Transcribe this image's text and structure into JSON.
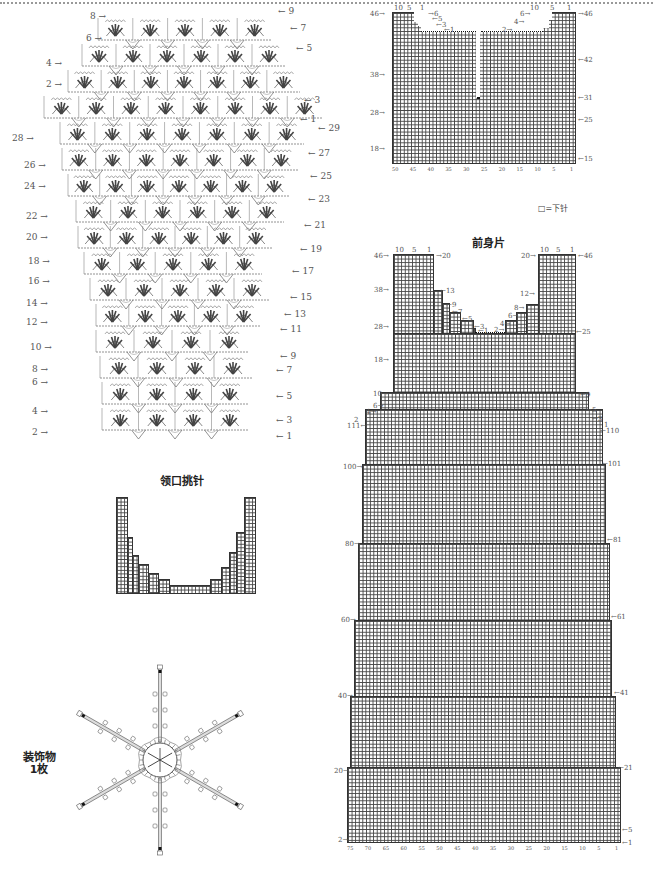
{
  "page": {
    "border": "dotted-top-rule"
  },
  "crochet_chart": {
    "description": "Crochet fan stitch chart",
    "left_row_labels": [
      "8",
      "6",
      "4",
      "2",
      "28",
      "26",
      "24",
      "22",
      "20",
      "18",
      "16",
      "14",
      "12",
      "10",
      "8",
      "6",
      "4",
      "2"
    ],
    "right_row_labels": [
      "9",
      "7",
      "5",
      "3",
      "1",
      "29",
      "27",
      "25",
      "23",
      "21",
      "19",
      "17",
      "15",
      "13",
      "11",
      "9",
      "7",
      "5",
      "3",
      "1"
    ]
  },
  "back_neck": {
    "title": "后领",
    "top_left_ticks": [
      "10",
      "5",
      "1"
    ],
    "top_right_ticks": [
      "10",
      "5",
      "1"
    ],
    "left_row_labels": [
      "46",
      "38",
      "28",
      "18"
    ],
    "right_row_labels": [
      "46",
      "42",
      "31",
      "25",
      "15"
    ],
    "neck_left_labels": [
      "6",
      "5",
      "3",
      "1"
    ],
    "neck_right_labels": [
      "6",
      "4",
      "2"
    ],
    "bottom_ticks": [
      "50",
      "45",
      "40",
      "35",
      "30",
      "25",
      "20",
      "15",
      "10",
      "5",
      "1"
    ]
  },
  "legend": {
    "symbol": "□",
    "text": "=下针"
  },
  "front_body": {
    "title": "前身片",
    "top_left_ticks": [
      "10",
      "5",
      "1"
    ],
    "top_right_ticks": [
      "10",
      "5",
      "1"
    ],
    "left_row_labels": [
      "46",
      "38",
      "28",
      "18",
      "10",
      "6",
      "4",
      "2",
      "111",
      "100",
      "80",
      "60",
      "40",
      "20",
      "2"
    ],
    "right_row_labels": [
      "46",
      "25",
      "9",
      "5",
      "3",
      "1",
      "110",
      "101",
      "81",
      "61",
      "41",
      "21",
      "5",
      "1"
    ],
    "top_left_strap_right_label": "20",
    "top_right_strap_left_label": "20",
    "neck_left_labels": [
      "13",
      "9",
      "7",
      "5",
      "3",
      "1"
    ],
    "neck_right_labels": [
      "12",
      "8",
      "6",
      "4",
      "2"
    ],
    "bottom_ticks": [
      "75",
      "70",
      "65",
      "60",
      "55",
      "50",
      "45",
      "40",
      "35",
      "30",
      "25",
      "20",
      "15",
      "10",
      "5",
      "1"
    ]
  },
  "neckline_pickup": {
    "title": "领口挑针"
  },
  "ornament": {
    "label_line1": "装饰物",
    "label_line2": "1枚",
    "spokes": 6
  }
}
